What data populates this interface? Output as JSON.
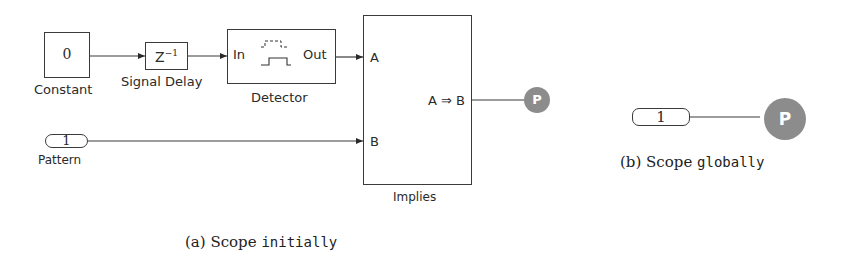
{
  "figure_a": {
    "constant": {
      "value": "0",
      "label": "Constant"
    },
    "signal_delay": {
      "symbol": "Z",
      "exponent": "−1",
      "label": "Signal Delay"
    },
    "detector": {
      "in_label": "In",
      "out_label": "Out",
      "label": "Detector"
    },
    "implies": {
      "port_a": "A",
      "port_b": "B",
      "expression": "A ⇒  B",
      "label": "Implies"
    },
    "pattern": {
      "value": "1",
      "label": "Pattern"
    },
    "property_badge": "P",
    "caption": {
      "prefix": "(a) Scope ",
      "keyword": "initially"
    }
  },
  "figure_b": {
    "pattern": {
      "value": "1"
    },
    "property_badge": "P",
    "caption": {
      "prefix": "(b) Scope ",
      "keyword": "globally"
    }
  },
  "colors": {
    "line": "#3a3a3a",
    "badge": "#8c8c8c"
  }
}
